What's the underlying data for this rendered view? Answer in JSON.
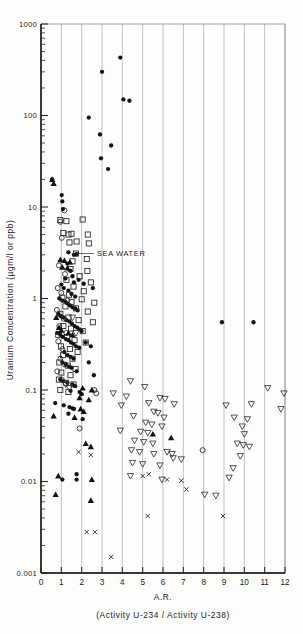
{
  "chart_data": {
    "type": "scatter",
    "title": "",
    "xlabel": "A.R.",
    "xlabel_sub": "(Activity U-234 / Activity U-238)",
    "ylabel": "Uranium Concentration (µgm/l or ppb)",
    "xlim": [
      0,
      12
    ],
    "ylim": [
      0.001,
      1000
    ],
    "yscale": "log",
    "xscale": "linear",
    "grid": "vertical-only-at-integer-x",
    "legend": "none",
    "xticks": [
      "0",
      "1",
      "2",
      "3",
      "4",
      "5",
      "6",
      "7",
      "8",
      "9",
      "10",
      "11",
      "12"
    ],
    "yticks": [
      "1000",
      "100",
      "10",
      "1",
      "0.1",
      "0.01",
      "0.001"
    ],
    "ytick_values": [
      1000,
      100,
      10,
      1,
      0.1,
      0.01,
      0.001
    ],
    "annotations": [
      {
        "text": "SEA WATER",
        "x": 2.7,
        "y": 3.1,
        "leader_to_x": 1.75,
        "leader_to_y": 3.1
      }
    ],
    "series": [
      {
        "name": "filled-circle",
        "marker": "filled-circle",
        "color": "#111111",
        "points": [
          [
            3.0,
            300
          ],
          [
            3.9,
            430
          ],
          [
            4.05,
            150
          ],
          [
            4.35,
            145
          ],
          [
            2.35,
            95
          ],
          [
            2.9,
            62
          ],
          [
            2.95,
            34
          ],
          [
            3.45,
            47
          ],
          [
            3.3,
            26
          ],
          [
            0.55,
            20
          ],
          [
            1.02,
            13.5
          ],
          [
            1.05,
            11.5
          ],
          [
            1.08,
            9.5
          ],
          [
            1.35,
            3.2
          ],
          [
            1.62,
            3.0
          ],
          [
            1.75,
            3.05
          ],
          [
            1.3,
            2.4
          ],
          [
            1.45,
            2.0
          ],
          [
            1.55,
            1.75
          ],
          [
            1.62,
            1.5
          ],
          [
            1.2,
            1.65
          ],
          [
            1.0,
            1.42
          ],
          [
            1.12,
            1.3
          ],
          [
            1.35,
            1.22
          ],
          [
            1.5,
            1.12
          ],
          [
            1.68,
            1.05
          ],
          [
            1.85,
            1.6
          ],
          [
            2.1,
            1.45
          ],
          [
            2.55,
            1.3
          ],
          [
            0.9,
            1.0
          ],
          [
            1.05,
            0.95
          ],
          [
            1.2,
            0.92
          ],
          [
            1.3,
            0.88
          ],
          [
            1.42,
            0.84
          ],
          [
            1.55,
            0.8
          ],
          [
            1.68,
            0.78
          ],
          [
            1.8,
            0.74
          ],
          [
            0.85,
            0.68
          ],
          [
            0.98,
            0.64
          ],
          [
            1.1,
            0.62
          ],
          [
            1.25,
            0.58
          ],
          [
            1.4,
            0.56
          ],
          [
            1.52,
            0.53
          ],
          [
            1.65,
            0.5
          ],
          [
            1.78,
            0.48
          ],
          [
            1.9,
            0.46
          ],
          [
            2.0,
            0.44
          ],
          [
            0.8,
            0.42
          ],
          [
            0.95,
            0.4
          ],
          [
            1.08,
            0.38
          ],
          [
            1.22,
            0.36
          ],
          [
            1.35,
            0.35
          ],
          [
            1.48,
            0.33
          ],
          [
            1.6,
            0.32
          ],
          [
            1.72,
            0.3
          ],
          [
            1.88,
            0.29
          ],
          [
            2.2,
            0.33
          ],
          [
            2.45,
            0.3
          ],
          [
            1.15,
            0.26
          ],
          [
            1.3,
            0.24
          ],
          [
            1.45,
            0.23
          ],
          [
            1.6,
            0.22
          ],
          [
            1.05,
            0.2
          ],
          [
            1.22,
            0.19
          ],
          [
            1.38,
            0.18
          ],
          [
            1.5,
            0.175
          ],
          [
            1.75,
            0.16
          ],
          [
            2.35,
            0.2
          ],
          [
            2.6,
            0.145
          ],
          [
            0.95,
            0.13
          ],
          [
            1.1,
            0.125
          ],
          [
            1.3,
            0.12
          ],
          [
            1.55,
            0.115
          ],
          [
            1.68,
            0.11
          ],
          [
            1.45,
            0.098
          ],
          [
            1.9,
            0.095
          ],
          [
            2.0,
            0.09
          ],
          [
            0.7,
            0.072
          ],
          [
            1.12,
            0.068
          ],
          [
            1.4,
            0.065
          ],
          [
            1.55,
            0.063
          ],
          [
            1.62,
            0.062
          ],
          [
            1.35,
            0.055
          ],
          [
            2.05,
            0.048
          ],
          [
            8.9,
            0.55
          ],
          [
            10.45,
            0.55
          ],
          [
            1.75,
            0.012
          ],
          [
            1.05,
            0.0105
          ],
          [
            1.75,
            0.0105
          ]
        ]
      },
      {
        "name": "open-square",
        "marker": "open-square",
        "color": "#222222",
        "points": [
          [
            0.95,
            7.2
          ],
          [
            1.25,
            7.0
          ],
          [
            2.05,
            7.3
          ],
          [
            1.1,
            5.2
          ],
          [
            1.35,
            5.0
          ],
          [
            1.5,
            5.1
          ],
          [
            2.3,
            5.0
          ],
          [
            1.4,
            4.1
          ],
          [
            1.75,
            4.2
          ],
          [
            2.35,
            4.0
          ],
          [
            1.72,
            3.1
          ],
          [
            2.25,
            2.7
          ],
          [
            1.55,
            2.55
          ],
          [
            1.45,
            2.1
          ],
          [
            2.28,
            2.0
          ],
          [
            1.9,
            1.75
          ],
          [
            1.25,
            1.6
          ],
          [
            2.45,
            1.5
          ],
          [
            1.6,
            1.35
          ],
          [
            2.1,
            1.2
          ],
          [
            1.38,
            1.1
          ],
          [
            1.05,
            1.02
          ],
          [
            2.0,
            0.98
          ],
          [
            1.5,
            0.92
          ],
          [
            2.62,
            0.9
          ],
          [
            1.2,
            0.82
          ],
          [
            1.72,
            0.78
          ],
          [
            2.3,
            0.72
          ],
          [
            0.95,
            0.68
          ],
          [
            1.35,
            0.62
          ],
          [
            1.85,
            0.58
          ],
          [
            2.55,
            0.55
          ],
          [
            1.1,
            0.5
          ],
          [
            1.48,
            0.47
          ],
          [
            2.05,
            0.44
          ],
          [
            0.85,
            0.4
          ],
          [
            1.28,
            0.38
          ],
          [
            1.65,
            0.35
          ],
          [
            2.2,
            0.33
          ],
          [
            0.98,
            0.3
          ],
          [
            1.42,
            0.28
          ],
          [
            1.8,
            0.26
          ],
          [
            1.08,
            0.24
          ],
          [
            1.55,
            0.22
          ],
          [
            0.9,
            0.2
          ],
          [
            1.32,
            0.185
          ],
          [
            1.7,
            0.17
          ],
          [
            1.0,
            0.155
          ],
          [
            1.45,
            0.145
          ],
          [
            0.88,
            0.13
          ],
          [
            1.22,
            0.12
          ],
          [
            1.6,
            0.115
          ],
          [
            0.95,
            0.1
          ],
          [
            1.35,
            0.095
          ]
        ]
      },
      {
        "name": "open-circle",
        "marker": "open-circle",
        "color": "#222222",
        "points": [
          [
            1.15,
            9.2
          ],
          [
            0.95,
            6.9
          ],
          [
            1.02,
            4.6
          ],
          [
            0.88,
            2.3
          ],
          [
            1.18,
            1.85
          ],
          [
            0.82,
            1.3
          ],
          [
            1.0,
            1.15
          ],
          [
            1.3,
            0.95
          ],
          [
            0.78,
            0.75
          ],
          [
            1.12,
            0.6
          ],
          [
            0.9,
            0.5
          ],
          [
            1.25,
            0.42
          ],
          [
            0.85,
            0.34
          ],
          [
            1.05,
            0.28
          ],
          [
            0.95,
            0.22
          ],
          [
            1.18,
            0.19
          ],
          [
            0.8,
            0.16
          ],
          [
            1.02,
            0.13
          ],
          [
            2.62,
            0.1
          ],
          [
            2.72,
            0.092
          ],
          [
            1.9,
            0.038
          ],
          [
            7.95,
            0.022
          ]
        ]
      },
      {
        "name": "filled-triangle",
        "marker": "filled-triangle",
        "color": "#111111",
        "points": [
          [
            0.55,
            20
          ],
          [
            0.62,
            18
          ],
          [
            0.95,
            2.65
          ],
          [
            1.15,
            2.6
          ],
          [
            1.42,
            2.5
          ],
          [
            1.05,
            2.2
          ],
          [
            1.3,
            2.15
          ],
          [
            0.75,
            0.62
          ],
          [
            0.88,
            0.48
          ],
          [
            1.0,
            0.45
          ],
          [
            1.35,
            0.42
          ],
          [
            1.55,
            0.4
          ],
          [
            2.05,
            0.105
          ],
          [
            2.5,
            0.1
          ],
          [
            1.9,
            0.082
          ],
          [
            2.35,
            0.078
          ],
          [
            1.95,
            0.062
          ],
          [
            2.1,
            0.058
          ],
          [
            0.62,
            0.052
          ],
          [
            1.65,
            0.05
          ],
          [
            5.5,
            0.033
          ],
          [
            6.4,
            0.03
          ],
          [
            2.2,
            0.026
          ],
          [
            2.45,
            0.024
          ],
          [
            0.85,
            0.0115
          ],
          [
            2.5,
            0.0105
          ],
          [
            0.72,
            0.0072
          ],
          [
            2.45,
            0.0062
          ]
        ]
      },
      {
        "name": "open-down-triangle",
        "marker": "open-down-triangle",
        "color": "#333333",
        "points": [
          [
            1.55,
            0.62
          ],
          [
            1.72,
            0.42
          ],
          [
            1.22,
            0.115
          ],
          [
            1.4,
            0.105
          ],
          [
            4.4,
            0.125
          ],
          [
            5.1,
            0.108
          ],
          [
            3.55,
            0.092
          ],
          [
            4.2,
            0.085
          ],
          [
            11.15,
            0.105
          ],
          [
            11.95,
            0.092
          ],
          [
            5.85,
            0.082
          ],
          [
            6.1,
            0.08
          ],
          [
            5.3,
            0.072
          ],
          [
            6.55,
            0.07
          ],
          [
            3.95,
            0.068
          ],
          [
            9.1,
            0.068
          ],
          [
            10.35,
            0.07
          ],
          [
            11.8,
            0.062
          ],
          [
            5.55,
            0.058
          ],
          [
            5.75,
            0.056
          ],
          [
            4.55,
            0.052
          ],
          [
            6.05,
            0.05
          ],
          [
            9.5,
            0.05
          ],
          [
            10.15,
            0.048
          ],
          [
            5.15,
            0.044
          ],
          [
            5.45,
            0.042
          ],
          [
            5.95,
            0.04
          ],
          [
            9.9,
            0.04
          ],
          [
            3.9,
            0.036
          ],
          [
            4.9,
            0.035
          ],
          [
            5.25,
            0.034
          ],
          [
            10.0,
            0.033
          ],
          [
            4.6,
            0.028
          ],
          [
            5.05,
            0.027
          ],
          [
            5.5,
            0.026
          ],
          [
            9.65,
            0.026
          ],
          [
            9.95,
            0.025
          ],
          [
            10.25,
            0.024
          ],
          [
            4.45,
            0.022
          ],
          [
            4.85,
            0.021
          ],
          [
            5.55,
            0.02
          ],
          [
            9.8,
            0.019
          ],
          [
            6.2,
            0.021
          ],
          [
            6.45,
            0.02
          ],
          [
            4.5,
            0.016
          ],
          [
            5.0,
            0.0155
          ],
          [
            5.85,
            0.015
          ],
          [
            9.45,
            0.014
          ],
          [
            6.5,
            0.018
          ],
          [
            6.9,
            0.0175
          ],
          [
            4.4,
            0.0115
          ],
          [
            9.25,
            0.011
          ],
          [
            5.95,
            0.0105
          ],
          [
            8.05,
            0.0072
          ],
          [
            8.6,
            0.007
          ]
        ]
      },
      {
        "name": "x-cross",
        "marker": "x",
        "color": "#333333",
        "points": [
          [
            1.85,
            0.021
          ],
          [
            2.45,
            0.0195
          ],
          [
            5.0,
            0.0115
          ],
          [
            5.3,
            0.012
          ],
          [
            6.2,
            0.0105
          ],
          [
            6.9,
            0.0102
          ],
          [
            7.15,
            0.0082
          ],
          [
            5.25,
            0.0042
          ],
          [
            8.95,
            0.0042
          ],
          [
            2.25,
            0.0028
          ],
          [
            2.65,
            0.0028
          ],
          [
            3.45,
            0.0015
          ]
        ]
      }
    ]
  }
}
